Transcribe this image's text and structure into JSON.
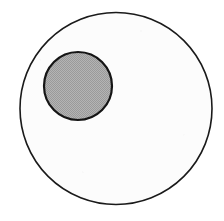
{
  "figure": {
    "canvas": {
      "width": 224,
      "height": 221,
      "background_color": "#ffffff"
    },
    "shapes": [
      {
        "name": "outer-circle",
        "type": "circle",
        "cx": 116,
        "cy": 108.5,
        "r": 96,
        "fill_color": "#fcfcfc",
        "stroke_color": "#1a1a1a",
        "stroke_width": 1.6,
        "fill_style": "solid-white",
        "label": "Outer circle"
      },
      {
        "name": "inner-circle",
        "type": "circle",
        "cx": 78,
        "cy": 86,
        "r": 34,
        "fill_color": "#a9a9a9",
        "stroke_color": "#151515",
        "stroke_width": 2.2,
        "fill_style": "gray-halftone",
        "label": "Inner shaded circle"
      }
    ],
    "relationship": "inner circle is fully contained within the outer circle, offset up and to the left of center"
  }
}
